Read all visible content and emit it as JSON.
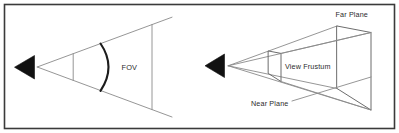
{
  "figure": {
    "background_color": "#ffffff",
    "border_color": "#3a3a3a",
    "line_color": "#8a8a8a",
    "arc_color": "#1c1c1c",
    "eye_color": "#111111",
    "label_color": "#2b2b2b",
    "width": 399,
    "height": 133
  },
  "panels": {
    "left": {
      "name": "field-of-view-panel",
      "eye_icon": "camera-eye-triangle-icon",
      "labels": {
        "fov": "FOV"
      }
    },
    "right": {
      "name": "view-frustum-panel",
      "eye_icon": "camera-eye-triangle-icon",
      "labels": {
        "far_plane": "Far Plane",
        "view_frustum": "View Frustum",
        "near_plane": "Near Plane"
      }
    }
  }
}
